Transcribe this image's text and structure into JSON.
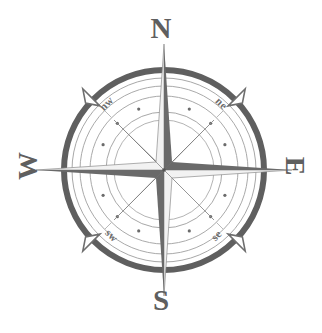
{
  "figure": {
    "background_color": "#ffffff",
    "ink_color": "#5f5f5f",
    "ink_color_light": "#9a9a9a",
    "ink_color_mid": "#7d7d7d",
    "center": {
      "x": 164,
      "y": 170
    },
    "outer_ring_radius": 102
  },
  "cardinals": {
    "north": {
      "label": "N",
      "abbrev": "N",
      "bearing_degrees": 0
    },
    "east": {
      "label": "E",
      "abbrev": "E",
      "bearing_degrees": 90
    },
    "south": {
      "label": "S",
      "abbrev": "S",
      "bearing_degrees": 180
    },
    "west": {
      "label": "W",
      "abbrev": "W",
      "bearing_degrees": 270
    }
  },
  "ordinals": {
    "northeast": {
      "label": "ne",
      "bearing_degrees": 45
    },
    "southeast": {
      "label": "se",
      "bearing_degrees": 135
    },
    "southwest": {
      "label": "sw",
      "bearing_degrees": 225
    },
    "northwest": {
      "label": "nw",
      "bearing_degrees": 315
    }
  },
  "rings": {
    "outer_heavy": {
      "radius": 100,
      "stroke_width": 6,
      "color": "#5f5f5f"
    },
    "outer_hairline": {
      "radius": 92,
      "stroke_width": 1,
      "color": "#9f9f9f"
    },
    "bearing_band_outer": {
      "radius": 84,
      "stroke_width": 1,
      "color": "#a5a5a5"
    },
    "bearing_band_inner": {
      "radius": 74,
      "stroke_width": 1,
      "color": "#a5a5a5"
    },
    "dotted": {
      "radius": 66,
      "dot_count": 16,
      "dot_radius": 1.6,
      "color": "#6b6b6b"
    },
    "inner_a": {
      "radius": 58,
      "stroke_width": 1,
      "color": "#9f9f9f"
    },
    "inner_b": {
      "radius": 50,
      "stroke_width": 1,
      "color": "#9f9f9f"
    }
  },
  "star": {
    "point_count": 8,
    "major_point_length": 132,
    "minor_point_length": 76,
    "shading": "alternating light and dark half-facets"
  },
  "fleurs": {
    "count": 4,
    "positions_degrees": [
      45,
      135,
      225,
      315
    ],
    "shape": "triangular spike"
  }
}
